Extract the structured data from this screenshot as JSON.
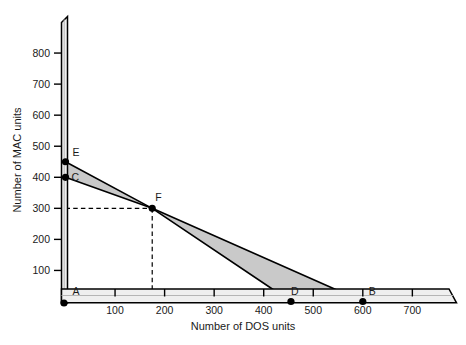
{
  "chart_data": {
    "type": "line",
    "title": "",
    "xlabel": "Number of DOS units",
    "ylabel": "Number of MAC units",
    "xlim": [
      0,
      780
    ],
    "ylim": [
      0,
      900
    ],
    "xticks": [
      100,
      200,
      300,
      400,
      500,
      600,
      700
    ],
    "yticks": [
      100,
      200,
      300,
      400,
      500,
      600,
      700,
      800
    ],
    "xtick_labels": [
      "100",
      "200",
      "300",
      "400",
      "500",
      "600",
      "700"
    ],
    "ytick_labels": [
      "100",
      "200",
      "300",
      "400",
      "500",
      "600",
      "700",
      "800"
    ],
    "grid": false,
    "legend": "none",
    "series": [
      {
        "name": "Frontier E-F-D",
        "points": [
          {
            "label": "E",
            "x": 0,
            "y": 450
          },
          {
            "label": "F",
            "x": 175,
            "y": 300
          },
          {
            "label": "D",
            "x": 455,
            "y": 0
          }
        ]
      },
      {
        "name": "Frontier C-F-B",
        "points": [
          {
            "label": "C",
            "x": 0,
            "y": 400
          },
          {
            "label": "F",
            "x": 175,
            "y": 300
          },
          {
            "label": "B",
            "x": 600,
            "y": 0
          }
        ]
      }
    ],
    "labeled_points": [
      {
        "label": "E",
        "x": 0,
        "y": 450
      },
      {
        "label": "C",
        "x": 0,
        "y": 400
      },
      {
        "label": "A",
        "x": 0,
        "y": 0
      },
      {
        "label": "F",
        "x": 175,
        "y": 300
      },
      {
        "label": "D",
        "x": 455,
        "y": 0
      },
      {
        "label": "B",
        "x": 600,
        "y": 0
      }
    ],
    "shaded_regions": [
      {
        "name": "sliver-E-C-F",
        "vertices": [
          [
            0,
            450
          ],
          [
            0,
            400
          ],
          [
            175,
            300
          ]
        ]
      },
      {
        "name": "triangle-F-D-B",
        "vertices": [
          [
            175,
            300
          ],
          [
            455,
            0
          ],
          [
            600,
            0
          ]
        ]
      }
    ],
    "guide_lines": [
      {
        "name": "horizontal-guide-at-300",
        "from": [
          0,
          300
        ],
        "to": [
          175,
          300
        ],
        "style": "dashed"
      },
      {
        "name": "vertical-guide-at-175",
        "from": [
          175,
          300
        ],
        "to": [
          175,
          0
        ],
        "style": "dashed"
      }
    ],
    "colors": {
      "shade_fill": "#c9c9c9",
      "line": "#000000",
      "axis_face": "#efefef",
      "axis_edge": "#000000",
      "text": "#1a1a1a"
    }
  }
}
